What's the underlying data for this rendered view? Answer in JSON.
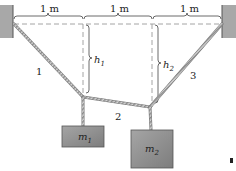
{
  "diagram": {
    "type": "statics-hanging-masses",
    "dimensions": {
      "segment_1": "1 m",
      "segment_2": "1 m",
      "segment_3": "1 m"
    },
    "heights": [
      {
        "symbol": "h",
        "subscript": "1"
      },
      {
        "symbol": "h",
        "subscript": "2"
      }
    ],
    "cables": [
      {
        "label": "1"
      },
      {
        "label": "2"
      },
      {
        "label": "3"
      }
    ],
    "masses": [
      {
        "symbol": "m",
        "subscript": "1"
      },
      {
        "symbol": "m",
        "subscript": "2"
      }
    ],
    "colors": {
      "wall": "#a8a8a8",
      "rope": "#9a9a9a",
      "mass_fill": "#8f8f8f",
      "dashed": "#9a9a9a",
      "text": "#222222"
    }
  }
}
